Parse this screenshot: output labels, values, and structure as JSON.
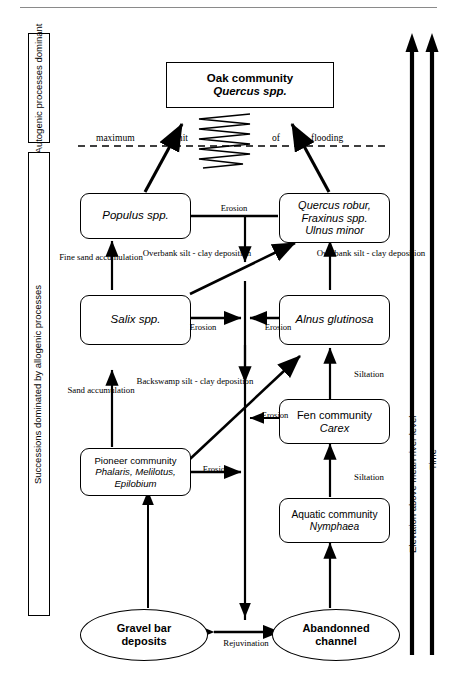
{
  "figure": {
    "title_rule": true,
    "left_panels": [
      {
        "id": "autogenic",
        "text": "Autogenic processes dominant"
      },
      {
        "id": "allogenic",
        "text": "Successions dominated by allogenic processes"
      }
    ],
    "right_axes": [
      {
        "id": "elevation",
        "label": "Elevation above mean river level"
      },
      {
        "id": "time",
        "label": "Time"
      }
    ],
    "flood_line": {
      "words": [
        "maximum",
        "limit",
        "of",
        "flooding"
      ],
      "full": "maximum limit of flooding",
      "style": "dashed"
    }
  },
  "nodes": [
    {
      "id": "oak",
      "shape": "rect",
      "lines": [
        "Oak community",
        "Quercus spp."
      ],
      "italic": [
        false,
        true
      ],
      "bold": true
    },
    {
      "id": "populus",
      "shape": "rounded",
      "lines": [
        "Populus spp."
      ],
      "italic": [
        true
      ]
    },
    {
      "id": "quercus",
      "shape": "rounded",
      "lines": [
        "Quercus robur,",
        "Fraxinus spp.",
        "Ulnus minor"
      ],
      "italic": [
        true,
        true,
        true
      ]
    },
    {
      "id": "salix",
      "shape": "rounded",
      "lines": [
        "Salix spp."
      ],
      "italic": [
        true
      ]
    },
    {
      "id": "alnus",
      "shape": "rounded",
      "lines": [
        "Alnus glutinosa"
      ],
      "italic": [
        true
      ]
    },
    {
      "id": "fen",
      "shape": "rounded",
      "lines": [
        "Fen community",
        "Carex"
      ],
      "italic": [
        false,
        true
      ]
    },
    {
      "id": "pioneer",
      "shape": "rounded",
      "lines": [
        "Pioneer community",
        "Phalaris, Melilotus,",
        "Epilobium"
      ],
      "italic": [
        false,
        true,
        true
      ]
    },
    {
      "id": "aquatic",
      "shape": "rounded",
      "lines": [
        "Aquatic community",
        "Nymphaea"
      ],
      "italic": [
        false,
        true
      ]
    },
    {
      "id": "gravel",
      "shape": "ellipse",
      "lines": [
        "Gravel bar",
        "deposits"
      ],
      "italic": [
        false,
        false
      ],
      "bold": true
    },
    {
      "id": "channel",
      "shape": "ellipse",
      "lines": [
        "Abandonned",
        "channel"
      ],
      "italic": [
        false,
        false
      ],
      "bold": true
    }
  ],
  "edge_labels": [
    {
      "id": "erosion-populus-quercus",
      "text": "Erosion"
    },
    {
      "id": "fine-sand",
      "text": "Fine sand\naccumulation",
      "lines": [
        "Fine sand",
        "accumulation"
      ]
    },
    {
      "id": "overbank-left",
      "text": "Overbank silt - clay deposition",
      "lines": [
        "Overbank",
        "silt - clay",
        "deposition"
      ]
    },
    {
      "id": "overbank-right",
      "text": "Overbank silt - clay deposition",
      "lines": [
        "Overbank",
        "silt - clay",
        "deposition"
      ]
    },
    {
      "id": "erosion-salix",
      "text": "Erosion"
    },
    {
      "id": "erosion-alnus",
      "text": "Erosion"
    },
    {
      "id": "sand-accumulation",
      "text": "Sand accumulation",
      "lines": [
        "Sand",
        "accumulation"
      ]
    },
    {
      "id": "backswamp",
      "text": "Backswamp silt - clay deposition",
      "lines": [
        "Backswamp",
        "silt - clay",
        "deposition"
      ]
    },
    {
      "id": "siltation-fen",
      "text": "Siltation"
    },
    {
      "id": "erosion-fen",
      "text": "Erosion"
    },
    {
      "id": "erosion-pioneer",
      "text": "Erosion"
    },
    {
      "id": "siltation-aquatic",
      "text": "Siltation"
    },
    {
      "id": "rejuvination",
      "text": "Rejuvination"
    }
  ],
  "colors": {
    "ink": "#000000",
    "paper": "#ffffff",
    "rule": "#8a8a8a"
  }
}
